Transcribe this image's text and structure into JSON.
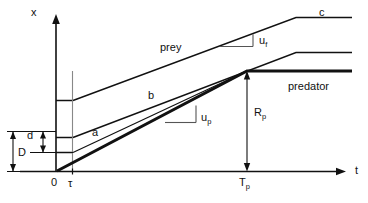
{
  "figure": {
    "type": "diagram",
    "background": "#ffffff",
    "line_color": "#111111"
  },
  "axes": {
    "y_axis_label": "x",
    "x_axis_label": "t",
    "origin_label": "0",
    "x_ticks": [
      {
        "id": "tau",
        "label": "τ"
      },
      {
        "id": "Tp",
        "label": "T",
        "sub": "p"
      }
    ]
  },
  "curves": [
    {
      "id": "curve-c",
      "label": "c",
      "style": "thin"
    },
    {
      "id": "curve-b",
      "label": "b",
      "style": "thin"
    },
    {
      "id": "curve-a",
      "label": "a",
      "style": "thin"
    },
    {
      "id": "curve-predator",
      "label": "predator",
      "style": "thick"
    },
    {
      "id": "curve-prey",
      "label": "prey",
      "style": "thin"
    }
  ],
  "annotations": {
    "prey": "prey",
    "predator": "predator",
    "c": "c",
    "b": "b",
    "a": "a",
    "u_f": {
      "base": "u",
      "sub": "f"
    },
    "u_p": {
      "base": "u",
      "sub": "p"
    },
    "R_p": {
      "base": "R",
      "sub": "p"
    },
    "D": "D",
    "d": "d"
  }
}
